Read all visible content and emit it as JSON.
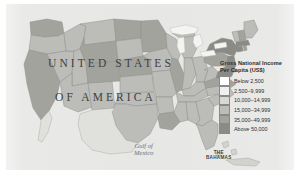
{
  "map": {
    "title_line1": "UNITED STATES",
    "title_line2": "OF AMERICA",
    "water_labels": {
      "gulf_line1": "Gulf of",
      "gulf_line2": "Mexico"
    },
    "country_labels": {
      "bahamas_line1": "THE",
      "bahamas_line2": "BAHAMAS"
    },
    "background_color": "#e7e7e5",
    "border_color": "#8a8a8a",
    "page_color": "#ffffff"
  },
  "legend": {
    "title_line1": "Gross National Income",
    "title_line2": "Per Capita (US$)",
    "classes": [
      {
        "label": "Below 2,500",
        "color": "#ffffff"
      },
      {
        "label": "2,500–9,999",
        "color": "#f0f0ee"
      },
      {
        "label": "10,000–14,999",
        "color": "#d8d8d5"
      },
      {
        "label": "15,000–34,999",
        "color": "#bcbcb8"
      },
      {
        "label": "35,000–49,999",
        "color": "#a3a39e"
      },
      {
        "label": "Above 50,000",
        "color": "#8b8b86"
      }
    ]
  },
  "chart_data": {
    "type": "choropleth",
    "title": "Gross National Income Per Capita (US$)",
    "unit": "US$",
    "legend_position": "right",
    "classes": [
      "Below 2,500",
      "2,500–9,999",
      "10,000–14,999",
      "15,000–34,999",
      "35,000–49,999",
      "Above 50,000"
    ],
    "regions": [
      {
        "name": "Washington",
        "class": 4
      },
      {
        "name": "Oregon",
        "class": 3
      },
      {
        "name": "California",
        "class": 4
      },
      {
        "name": "Nevada",
        "class": 3
      },
      {
        "name": "Idaho",
        "class": 3
      },
      {
        "name": "Montana",
        "class": 3
      },
      {
        "name": "Wyoming",
        "class": 4
      },
      {
        "name": "Utah",
        "class": 3
      },
      {
        "name": "Arizona",
        "class": 3
      },
      {
        "name": "New Mexico",
        "class": 3
      },
      {
        "name": "Colorado",
        "class": 4
      },
      {
        "name": "North Dakota",
        "class": 4
      },
      {
        "name": "South Dakota",
        "class": 3
      },
      {
        "name": "Nebraska",
        "class": 4
      },
      {
        "name": "Kansas",
        "class": 3
      },
      {
        "name": "Oklahoma",
        "class": 3
      },
      {
        "name": "Texas",
        "class": 3
      },
      {
        "name": "Minnesota",
        "class": 4
      },
      {
        "name": "Iowa",
        "class": 3
      },
      {
        "name": "Missouri",
        "class": 3
      },
      {
        "name": "Arkansas",
        "class": 3
      },
      {
        "name": "Louisiana",
        "class": 4
      },
      {
        "name": "Wisconsin",
        "class": 3
      },
      {
        "name": "Illinois",
        "class": 4
      },
      {
        "name": "Michigan",
        "class": 3
      },
      {
        "name": "Indiana",
        "class": 3
      },
      {
        "name": "Ohio",
        "class": 3
      },
      {
        "name": "Kentucky",
        "class": 3
      },
      {
        "name": "Tennessee",
        "class": 3
      },
      {
        "name": "Mississippi",
        "class": 3
      },
      {
        "name": "Alabama",
        "class": 3
      },
      {
        "name": "Georgia",
        "class": 3
      },
      {
        "name": "Florida",
        "class": 3
      },
      {
        "name": "South Carolina",
        "class": 3
      },
      {
        "name": "North Carolina",
        "class": 3
      },
      {
        "name": "Virginia",
        "class": 4
      },
      {
        "name": "West Virginia",
        "class": 3
      },
      {
        "name": "Maryland",
        "class": 5
      },
      {
        "name": "Delaware",
        "class": 5
      },
      {
        "name": "Pennsylvania",
        "class": 4
      },
      {
        "name": "New Jersey",
        "class": 5
      },
      {
        "name": "New York",
        "class": 5
      },
      {
        "name": "Connecticut",
        "class": 5
      },
      {
        "name": "Rhode Island",
        "class": 4
      },
      {
        "name": "Massachusetts",
        "class": 5
      },
      {
        "name": "Vermont",
        "class": 3
      },
      {
        "name": "New Hampshire",
        "class": 4
      },
      {
        "name": "Maine",
        "class": 3
      }
    ]
  }
}
